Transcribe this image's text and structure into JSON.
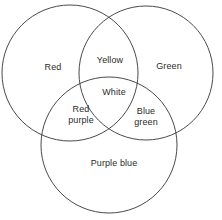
{
  "diagram": {
    "type": "venn",
    "title": "",
    "background_color": "#ffffff",
    "stroke_color": "#4a4a4a",
    "text_color": "#2b2b2b",
    "circles": [
      {
        "name": "red-circle",
        "cx": 70,
        "cy": 73,
        "r": 68
      },
      {
        "name": "green-circle",
        "cx": 146,
        "cy": 73,
        "r": 67
      },
      {
        "name": "purple-blue-circle",
        "cx": 109,
        "cy": 145,
        "r": 68
      }
    ],
    "regions": [
      {
        "key": "red",
        "label": "Red",
        "x": 53,
        "y": 67
      },
      {
        "key": "green",
        "label": "Green",
        "x": 169,
        "y": 66
      },
      {
        "key": "yellow",
        "label": "Yellow",
        "x": 110,
        "y": 60
      },
      {
        "key": "white",
        "label": "White",
        "x": 114,
        "y": 92
      },
      {
        "key": "red_purple",
        "label": "Red\npurple",
        "x": 81,
        "y": 115
      },
      {
        "key": "blue_green",
        "label": "Blue\ngreen",
        "x": 146,
        "y": 117
      },
      {
        "key": "purple_blue",
        "label": "Purple blue",
        "x": 114,
        "y": 163
      }
    ]
  }
}
